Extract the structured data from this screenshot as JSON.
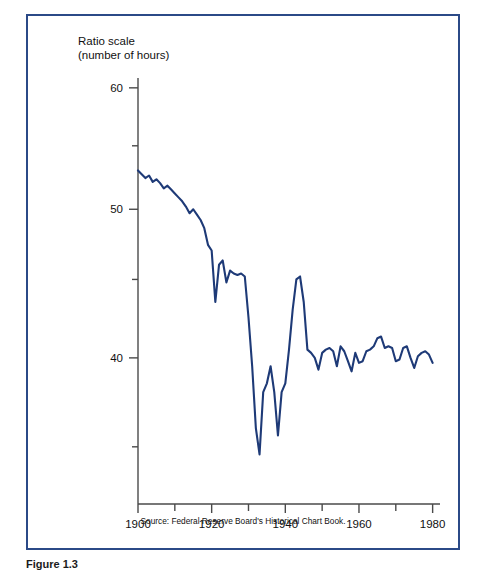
{
  "figure": {
    "frame_color": "#2b4a87",
    "line_color": "#1e3a77",
    "axis_color": "#4a4a4a",
    "background": "#ffffff"
  },
  "axis_title": {
    "line1": "Ratio scale",
    "line2": "(number of hours)"
  },
  "source_note": "Source: Federal Reserve Board's Historical Chart Book.",
  "caption": "Figure 1.3",
  "y_ticks": [
    {
      "value": 60,
      "label": "60",
      "major": true
    },
    {
      "value": 55,
      "label": "",
      "major": false
    },
    {
      "value": 50,
      "label": "50",
      "major": true
    },
    {
      "value": 45,
      "label": "",
      "major": false
    },
    {
      "value": 40,
      "label": "40",
      "major": true
    },
    {
      "value": 35,
      "label": "",
      "major": false
    }
  ],
  "x_ticks": [
    {
      "value": 1900,
      "label": "1900",
      "major": true
    },
    {
      "value": 1910,
      "label": "",
      "major": false
    },
    {
      "value": 1920,
      "label": "1920",
      "major": true
    },
    {
      "value": 1930,
      "label": "",
      "major": false
    },
    {
      "value": 1940,
      "label": "1940",
      "major": true
    },
    {
      "value": 1950,
      "label": "",
      "major": false
    },
    {
      "value": 1960,
      "label": "1960",
      "major": true
    },
    {
      "value": 1970,
      "label": "",
      "major": false
    },
    {
      "value": 1980,
      "label": "1980",
      "major": true
    }
  ],
  "chart_data": {
    "type": "line",
    "title": "",
    "subtitle": "",
    "xlabel": "",
    "ylabel": "Ratio scale (number of hours)",
    "yscale": "log",
    "xscale": "linear",
    "grid": false,
    "legend": "none",
    "xlim": [
      1900,
      1982
    ],
    "ylim": [
      33,
      62
    ],
    "annotations": [
      "Source: Federal Reserve Board's Historical Chart Book."
    ],
    "series": [
      {
        "name": "Average weekly hours worked",
        "x": [
          1900,
          1901,
          1902,
          1903,
          1904,
          1905,
          1906,
          1907,
          1908,
          1909,
          1910,
          1911,
          1912,
          1913,
          1914,
          1915,
          1916,
          1917,
          1918,
          1919,
          1920,
          1921,
          1922,
          1923,
          1924,
          1925,
          1926,
          1927,
          1928,
          1929,
          1930,
          1931,
          1932,
          1933,
          1934,
          1935,
          1936,
          1937,
          1938,
          1939,
          1940,
          1941,
          1942,
          1943,
          1944,
          1945,
          1946,
          1947,
          1948,
          1949,
          1950,
          1951,
          1952,
          1953,
          1954,
          1955,
          1956,
          1957,
          1958,
          1959,
          1960,
          1961,
          1962,
          1963,
          1964,
          1965,
          1966,
          1967,
          1968,
          1969,
          1970,
          1971,
          1972,
          1973,
          1974,
          1975,
          1976,
          1977,
          1978,
          1979,
          1980
        ],
        "values": [
          53.0,
          52.7,
          52.4,
          52.6,
          52.1,
          52.3,
          52.0,
          51.6,
          51.8,
          51.5,
          51.2,
          50.9,
          50.6,
          50.2,
          49.7,
          50.0,
          49.6,
          49.2,
          48.6,
          47.4,
          47.0,
          43.5,
          46.0,
          46.3,
          44.8,
          45.6,
          45.4,
          45.3,
          45.4,
          45.2,
          42.5,
          39.5,
          36.0,
          34.6,
          38.0,
          38.5,
          39.5,
          38.0,
          35.6,
          38.0,
          38.5,
          40.5,
          43.0,
          45.0,
          45.2,
          43.5,
          40.5,
          40.3,
          40.0,
          39.3,
          40.3,
          40.5,
          40.6,
          40.4,
          39.5,
          40.7,
          40.4,
          39.8,
          39.2,
          40.3,
          39.7,
          39.8,
          40.4,
          40.5,
          40.7,
          41.2,
          41.3,
          40.6,
          40.7,
          40.6,
          39.8,
          39.9,
          40.6,
          40.7,
          40.0,
          39.4,
          40.1,
          40.3,
          40.4,
          40.2,
          39.7
        ]
      }
    ]
  }
}
